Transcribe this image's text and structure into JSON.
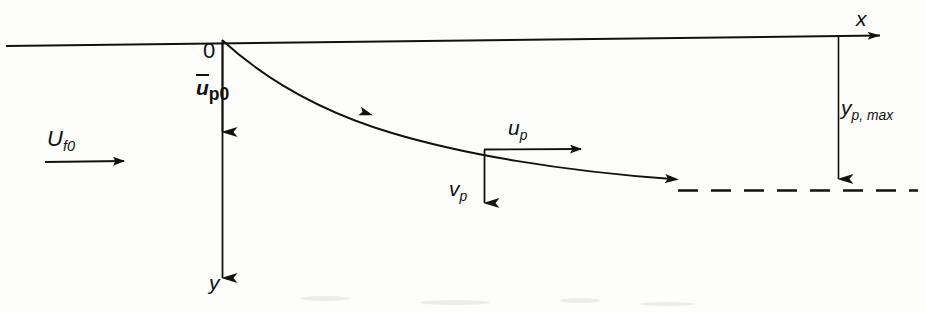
{
  "figure": {
    "background_color": "#fdfdfb",
    "ink_color": "#111111"
  },
  "labels": {
    "origin": "0",
    "x_axis": "x",
    "y_axis": "y",
    "mean_particle_velocity": {
      "symbol": "u",
      "overbar": true,
      "bold": true,
      "subscript": "p0"
    },
    "fluid_velocity": {
      "symbol": "U",
      "subscript": "f0"
    },
    "particle_velocity_x": {
      "symbol": "u",
      "subscript": "p"
    },
    "particle_velocity_y": {
      "symbol": "v",
      "subscript": "p"
    },
    "max_penetration_depth": {
      "symbol": "y",
      "subscript": "p, max"
    }
  },
  "geometry": {
    "origin_point": [
      222,
      40
    ],
    "x_axis": {
      "from": [
        6,
        46
      ],
      "to": [
        889,
        35
      ],
      "arrow": "right"
    },
    "y_axis": {
      "from": [
        222,
        40
      ],
      "to": [
        222,
        292
      ],
      "arrow": "down"
    },
    "mean_velocity_arrow": {
      "from": [
        222,
        42
      ],
      "to": [
        222,
        142
      ],
      "arrow": "down"
    },
    "fluid_flow_arrow": {
      "from": [
        45,
        162
      ],
      "to": [
        133,
        162
      ],
      "arrow": "right"
    },
    "trajectory": {
      "start": [
        222,
        40
      ],
      "end": [
        683,
        180
      ],
      "control_points": [
        [
          300,
          92
        ],
        [
          380,
          122
        ],
        [
          484,
          151
        ],
        [
          600,
          172
        ]
      ],
      "direction_arrow_at": [
        372,
        116
      ],
      "end_arrow": true
    },
    "decomposition_point": [
      484,
      151
    ],
    "up_arrow": {
      "from": [
        484,
        149
      ],
      "to": [
        590,
        149
      ],
      "arrow": "right"
    },
    "vp_arrow": {
      "from": [
        484,
        151
      ],
      "to": [
        484,
        216
      ],
      "arrow": "down"
    },
    "asymptote_dashed_line": {
      "y": 190,
      "from_x": 678,
      "to_x": 918,
      "dash": "20 13"
    },
    "depth_dimension_arrow": {
      "from": [
        838,
        36
      ],
      "to": [
        838,
        189
      ],
      "arrow": "down"
    }
  }
}
